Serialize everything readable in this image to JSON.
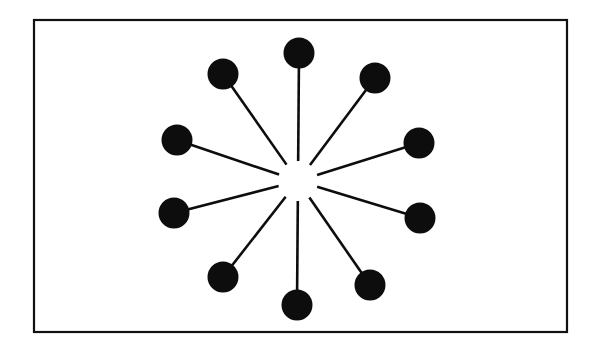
{
  "figure": {
    "canvas": {
      "width": 595,
      "height": 350,
      "background": "#ffffff"
    },
    "frame": {
      "name": "outer-border",
      "x": 34,
      "y": 20,
      "width": 533,
      "height": 312,
      "stroke": "#111111",
      "stroke_width": 2.2,
      "fill": "#ffffff"
    },
    "hub": {
      "name": "center-hub",
      "cx": 298,
      "cy": 181,
      "gap_radius": 20,
      "visible": false
    },
    "style": {
      "dot_fill": "#0d0d0d",
      "dot_radius": 15,
      "spoke_color": "#0d0d0d",
      "spoke_width": 2.6
    },
    "spoke_count": 10,
    "nodes": [
      {
        "id": "node-n",
        "label": "N",
        "angle_deg": 90,
        "cx": 299,
        "cy": 53,
        "r": 15.5
      },
      {
        "id": "node-nne",
        "label": "NNE",
        "angle_deg": 54,
        "cx": 375,
        "cy": 78,
        "r": 15.5
      },
      {
        "id": "node-ene",
        "label": "ENE",
        "angle_deg": 18,
        "cx": 419,
        "cy": 143,
        "r": 15.5
      },
      {
        "id": "node-ese",
        "label": "ESE",
        "angle_deg": -18,
        "cx": 420,
        "cy": 218,
        "r": 15.5
      },
      {
        "id": "node-sse",
        "label": "SSE",
        "angle_deg": -54,
        "cx": 370,
        "cy": 285,
        "r": 15.5
      },
      {
        "id": "node-s",
        "label": "S",
        "angle_deg": -90,
        "cx": 297,
        "cy": 305,
        "r": 15.5
      },
      {
        "id": "node-ssw",
        "label": "SSW",
        "angle_deg": 234,
        "cx": 223,
        "cy": 277,
        "r": 15.5
      },
      {
        "id": "node-wsw",
        "label": "WSW",
        "angle_deg": 198,
        "cx": 174,
        "cy": 213,
        "r": 15.5
      },
      {
        "id": "node-wnw",
        "label": "WNW",
        "angle_deg": 162,
        "cx": 177,
        "cy": 140,
        "r": 15.5
      },
      {
        "id": "node-nnw",
        "label": "NNW",
        "angle_deg": 126,
        "cx": 223,
        "cy": 74,
        "r": 15.5
      }
    ]
  },
  "chart_data": {
    "type": "scatter",
    "xlabel": "",
    "ylabel": "",
    "xlim": [
      34,
      567
    ],
    "ylim": [
      20,
      332
    ],
    "grid": false,
    "legend": null,
    "annotations": [],
    "center": {
      "x": 298,
      "y": 181
    },
    "categories": [
      "N",
      "NNE",
      "ENE",
      "ESE",
      "SSE",
      "S",
      "SSW",
      "WSW",
      "WNW",
      "NNW"
    ],
    "series": [
      {
        "name": "spoke endpoints",
        "points": [
          {
            "x": 299,
            "y": 53
          },
          {
            "x": 375,
            "y": 78
          },
          {
            "x": 419,
            "y": 143
          },
          {
            "x": 420,
            "y": 218
          },
          {
            "x": 370,
            "y": 285
          },
          {
            "x": 297,
            "y": 305
          },
          {
            "x": 223,
            "y": 277
          },
          {
            "x": 174,
            "y": 213
          },
          {
            "x": 177,
            "y": 140
          },
          {
            "x": 223,
            "y": 74
          }
        ]
      }
    ],
    "values": [
      128,
      80,
      121,
      124,
      113,
      124,
      123,
      128,
      129,
      131
    ]
  }
}
